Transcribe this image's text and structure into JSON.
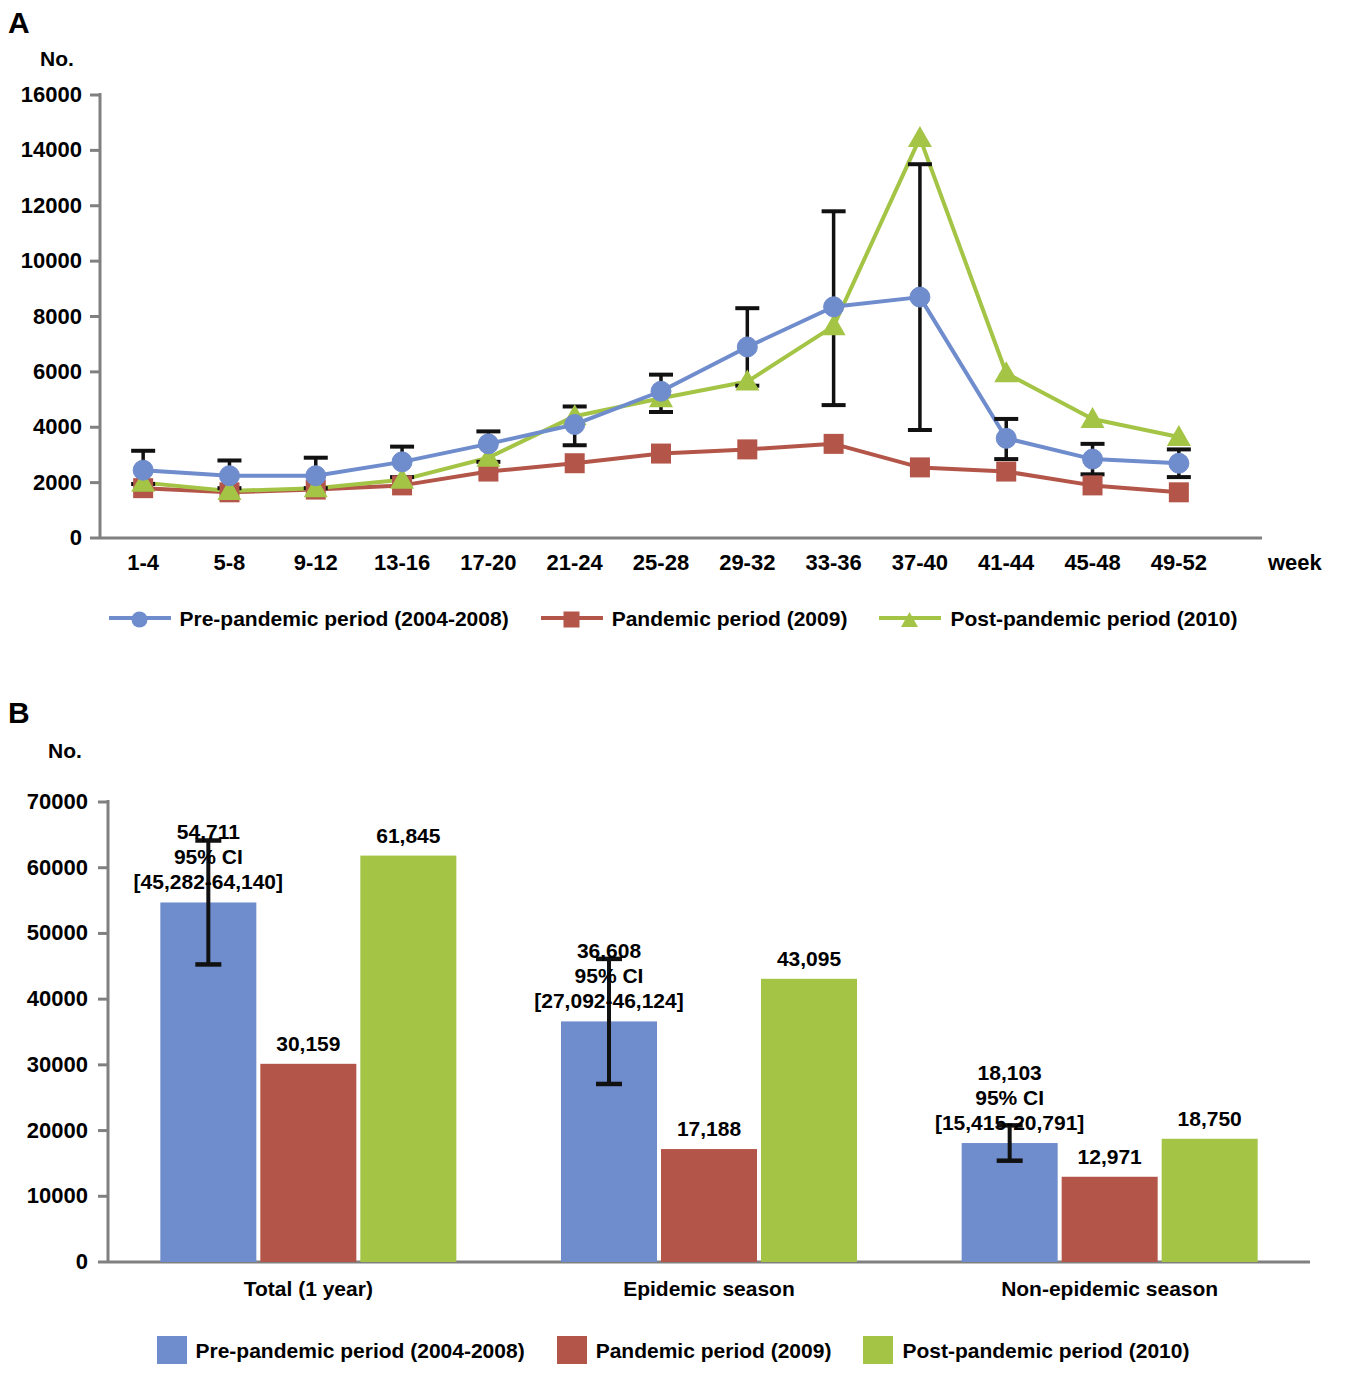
{
  "figure": {
    "panel_a_letter": "A",
    "panel_b_letter": "B"
  },
  "panel_a": {
    "y_axis_unit": "No.",
    "x_axis_unit": "week",
    "y_ticks": [
      "0",
      "2000",
      "4000",
      "6000",
      "8000",
      "10000",
      "12000",
      "14000",
      "16000"
    ],
    "x_ticks": [
      "1-4",
      "5-8",
      "9-12",
      "13-16",
      "17-20",
      "21-24",
      "25-28",
      "29-32",
      "33-36",
      "37-40",
      "41-44",
      "45-48",
      "49-52"
    ],
    "legend": [
      {
        "label": "Pre-pandemic period (2004-2008)",
        "color": "#6f8ccd",
        "marker": "circle"
      },
      {
        "label": "Pandemic period (2009)",
        "color": "#b4554a",
        "marker": "square"
      },
      {
        "label": "Post-pandemic period (2010)",
        "color": "#a4c446",
        "marker": "triangle"
      }
    ]
  },
  "panel_b": {
    "y_axis_unit": "No.",
    "y_ticks": [
      "0",
      "10000",
      "20000",
      "30000",
      "40000",
      "50000",
      "60000",
      "70000"
    ],
    "categories": [
      "Total (1 year)",
      "Epidemic season",
      "Non-epidemic season"
    ],
    "legend": [
      {
        "label": "Pre-pandemic period (2004-2008)",
        "color": "#6f8ccd"
      },
      {
        "label": "Pandemic period (2009)",
        "color": "#b4554a"
      },
      {
        "label": "Post-pandemic period (2010)",
        "color": "#a4c446"
      }
    ],
    "bar_labels": [
      "54,711\n95% CI\n[45,282-64,140]",
      "61,845",
      "36,608\n95% CI\n[27,092-46,124]",
      "43,095",
      "18,103\n95% CI\n[15,415-20,791]",
      "12,971",
      "18,750"
    ]
  },
  "chart_data": [
    {
      "type": "line",
      "panel": "A",
      "title": "",
      "xlabel": "week",
      "ylabel": "No.",
      "ylim": [
        0,
        16000
      ],
      "ytick_step": 2000,
      "grid": false,
      "legend_position": "bottom",
      "categories": [
        "1-4",
        "5-8",
        "9-12",
        "13-16",
        "17-20",
        "21-24",
        "25-28",
        "29-32",
        "33-36",
        "37-40",
        "41-44",
        "45-48",
        "49-52"
      ],
      "series": [
        {
          "name": "Pre-pandemic period (2004-2008)",
          "color": "#6f8ccd",
          "marker": "circle",
          "values": [
            2450,
            2250,
            2250,
            2750,
            3400,
            4100,
            5300,
            6900,
            8350,
            8700,
            3600,
            2850,
            2700
          ],
          "error_low": [
            1950,
            1800,
            1800,
            2200,
            2750,
            3350,
            4550,
            5500,
            4800,
            3900,
            2850,
            2300,
            2200
          ],
          "error_high": [
            3150,
            2800,
            2900,
            3300,
            3850,
            4750,
            5900,
            8300,
            11800,
            13500,
            4300,
            3400,
            3200
          ]
        },
        {
          "name": "Pandemic period (2009)",
          "color": "#b4554a",
          "marker": "square",
          "values": [
            1800,
            1650,
            1750,
            1900,
            2400,
            2700,
            3050,
            3200,
            3400,
            2550,
            2400,
            1900,
            1650
          ],
          "error_low": [],
          "error_high": []
        },
        {
          "name": "Post-pandemic period (2010)",
          "color": "#a4c446",
          "marker": "triangle",
          "values": [
            2000,
            1700,
            1800,
            2100,
            2900,
            4400,
            5050,
            5650,
            7650,
            14450,
            5950,
            4300,
            3650
          ],
          "error_low": [],
          "error_high": []
        }
      ]
    },
    {
      "type": "bar",
      "panel": "B",
      "title": "",
      "xlabel": "",
      "ylabel": "No.",
      "ylim": [
        0,
        70000
      ],
      "ytick_step": 10000,
      "grid": false,
      "legend_position": "bottom",
      "categories": [
        "Total (1 year)",
        "Epidemic season",
        "Non-epidemic season"
      ],
      "series": [
        {
          "name": "Pre-pandemic period (2004-2008)",
          "color": "#6f8ccd",
          "values": [
            54711,
            36608,
            18103
          ],
          "error_low": [
            45282,
            27092,
            15415
          ],
          "error_high": [
            64140,
            46124,
            20791
          ],
          "labels": [
            "54,711\n95% CI\n[45,282-64,140]",
            "36,608\n95% CI\n[27,092-46,124]",
            "18,103\n95% CI\n[15,415-20,791]"
          ]
        },
        {
          "name": "Pandemic period (2009)",
          "color": "#b4554a",
          "values": [
            30159,
            17188,
            12971
          ],
          "labels": [
            "30,159",
            "17,188",
            "12,971"
          ]
        },
        {
          "name": "Post-pandemic period (2010)",
          "color": "#a4c446",
          "values": [
            61845,
            43095,
            18750
          ],
          "labels": [
            "61,845",
            "43,095",
            "18,750"
          ]
        }
      ]
    }
  ]
}
